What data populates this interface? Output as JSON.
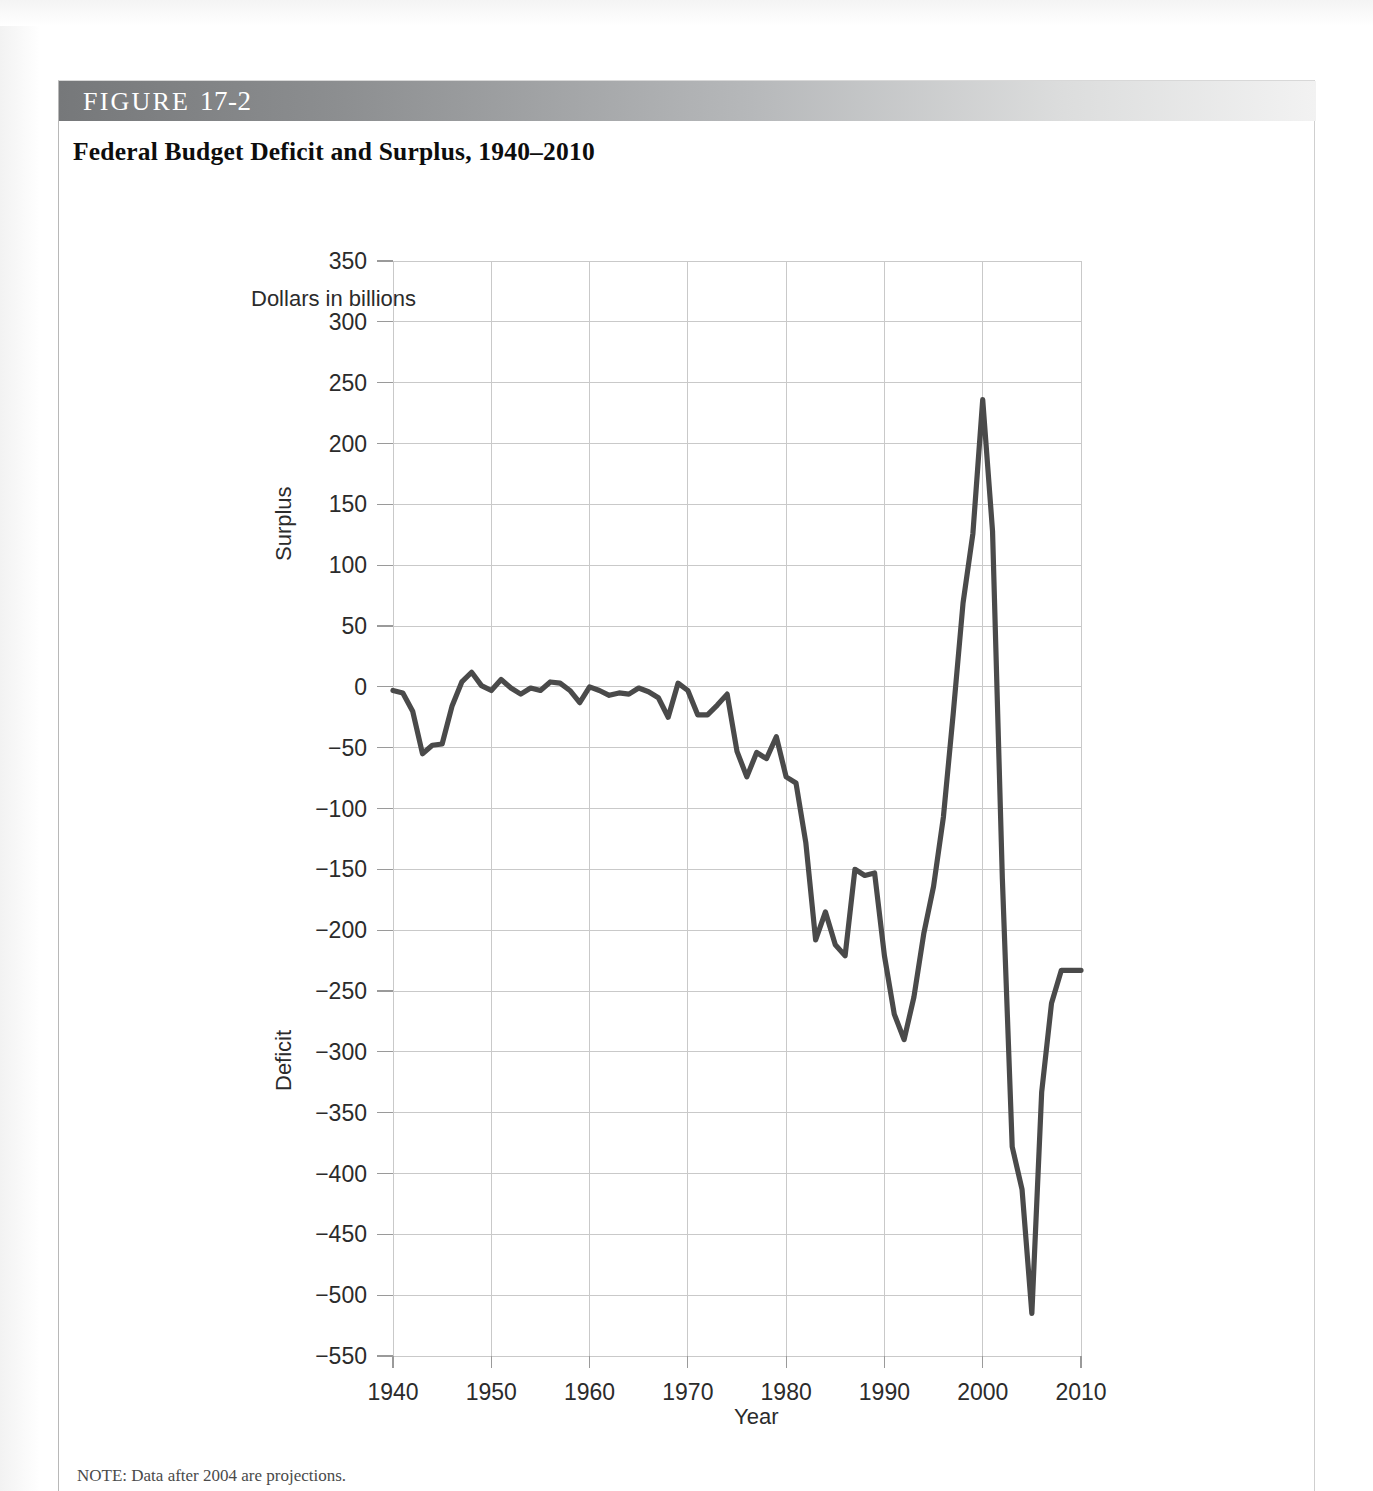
{
  "figure": {
    "bar_label": "FIGURE",
    "number": "17-2",
    "title": "Federal Budget Deficit and Surplus, 1940–2010",
    "note": "NOTE: Data after 2004 are projections."
  },
  "colors": {
    "bar_dark": "#76787a",
    "bar_light": "#f2f2f2",
    "line": "#4a4a4a",
    "grid": "#c9c9c9",
    "text": "#2b2b2b"
  },
  "chart_data": {
    "type": "line",
    "title": "Federal Budget Deficit and Surplus, 1940–2010",
    "xlabel": "Year",
    "ylabel": "Dollars in billions",
    "y_axis_top_label": "Surplus",
    "y_axis_bottom_label": "Deficit",
    "xlim": [
      1940,
      2010
    ],
    "ylim": [
      -550,
      350
    ],
    "grid": true,
    "legend": "none",
    "xticks": [
      1940,
      1950,
      1960,
      1970,
      1980,
      1990,
      2000,
      2010
    ],
    "xtick_labels": [
      "1940",
      "1950",
      "1960",
      "1970",
      "1980",
      "1990",
      "2000",
      "2010"
    ],
    "yticks": [
      350,
      300,
      250,
      200,
      150,
      100,
      50,
      0,
      -50,
      -100,
      -150,
      -200,
      -250,
      -300,
      -350,
      -400,
      -450,
      -500,
      -550
    ],
    "ytick_labels": [
      "350",
      "300",
      "250",
      "200",
      "150",
      "100",
      "50",
      "0",
      "−50",
      "−100",
      "−150",
      "−200",
      "−250",
      "−300",
      "−350",
      "−400",
      "−450",
      "−500",
      "−550"
    ],
    "series": [
      {
        "name": "Federal budget surplus or deficit",
        "x": [
          1940,
          1941,
          1942,
          1943,
          1944,
          1945,
          1946,
          1947,
          1948,
          1949,
          1950,
          1951,
          1952,
          1953,
          1954,
          1955,
          1956,
          1957,
          1958,
          1959,
          1960,
          1961,
          1962,
          1963,
          1964,
          1965,
          1966,
          1967,
          1968,
          1969,
          1970,
          1971,
          1972,
          1973,
          1974,
          1975,
          1976,
          1977,
          1978,
          1979,
          1980,
          1981,
          1982,
          1983,
          1984,
          1985,
          1986,
          1987,
          1988,
          1989,
          1990,
          1991,
          1992,
          1993,
          1994,
          1995,
          1996,
          1997,
          1998,
          1999,
          2000,
          2001,
          2002,
          2003,
          2004,
          2005,
          2006,
          2007,
          2008,
          2009,
          2010
        ],
        "values": [
          -3,
          -5,
          -20,
          -55,
          -48,
          -47,
          -16,
          4,
          12,
          1,
          -3,
          6,
          -1,
          -6,
          -1,
          -3,
          4,
          3,
          -3,
          -13,
          0,
          -3,
          -7,
          -5,
          -6,
          -1,
          -4,
          -9,
          -25,
          3,
          -3,
          -23,
          -23,
          -15,
          -6,
          -53,
          -74,
          -54,
          -59,
          -41,
          -74,
          -79,
          -128,
          -208,
          -185,
          -212,
          -221,
          -150,
          -155,
          -153,
          -221,
          -269,
          -290,
          -255,
          -203,
          -164,
          -107,
          -22,
          69,
          126,
          236,
          128,
          -158,
          -378,
          -413,
          -515,
          -333,
          -260,
          -233,
          -233,
          -233
        ]
      }
    ],
    "annotations": {
      "peak_year": 2000,
      "peak_value": 236,
      "trough_year": 2005,
      "trough_value": -515
    }
  }
}
